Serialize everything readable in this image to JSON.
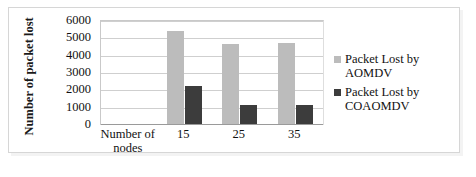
{
  "chart_data": {
    "type": "bar",
    "title": "",
    "xlabel": "Number of nodes",
    "ylabel": "Number of packet lost",
    "categories": [
      "15",
      "25",
      "35"
    ],
    "ylim": [
      0,
      6000
    ],
    "yticks": [
      "0",
      "1000",
      "2000",
      "3000",
      "4000",
      "5000",
      "6000"
    ],
    "grid": true,
    "legend_position": "right",
    "series": [
      {
        "name": "Packet Lost by AOMDV",
        "color": "#bcbcbc",
        "values": [
          5400,
          4700,
          4750
        ]
      },
      {
        "name": "Packet Lost by COAOMDV",
        "color": "#3c3c3c",
        "values": [
          2250,
          1150,
          1150
        ]
      }
    ]
  },
  "axis": {
    "y_title": "Number of packet lost",
    "x_category_title": "Number of nodes"
  },
  "legend": {
    "items": [
      {
        "label": "Packet Lost by AOMDV",
        "swatch": "light-gray-square"
      },
      {
        "label": "Packet Lost by COAOMDV",
        "swatch": "dark-gray-square"
      }
    ]
  }
}
